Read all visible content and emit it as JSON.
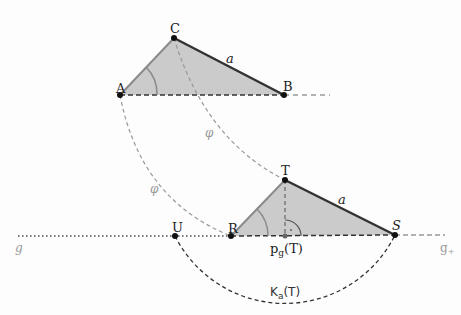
{
  "diagram": {
    "colors": {
      "fill": "#c9c9c9",
      "edge": "#8a8a8a",
      "side_a": "#333333",
      "dashed": "#888888",
      "point": "#111111"
    },
    "triangle_abc": {
      "points": {
        "A": {
          "label": "A",
          "x": 120,
          "y": 95
        },
        "B": {
          "label": "B",
          "x": 284,
          "y": 95
        },
        "C": {
          "label": "C",
          "x": 174,
          "y": 38
        }
      },
      "side_label": "a"
    },
    "triangle_rst": {
      "points": {
        "R": {
          "label": "R",
          "x": 231,
          "y": 236
        },
        "S": {
          "label": "S",
          "x": 395,
          "y": 235
        },
        "T": {
          "label": "T",
          "x": 285,
          "y": 180
        }
      },
      "side_label": "a",
      "foot_label_main": "p",
      "foot_label_sub": "g",
      "foot_label_arg": "(T)"
    },
    "point_u": {
      "label": "U",
      "x": 175,
      "y": 236
    },
    "arc_labels": [
      "φ",
      "φ"
    ],
    "circle_label_main": "K",
    "circle_label_sub": "a",
    "circle_label_arg": "(T)",
    "line_g_label": "g",
    "ray_g_plus_main": "g",
    "ray_g_plus_sub": "+"
  }
}
